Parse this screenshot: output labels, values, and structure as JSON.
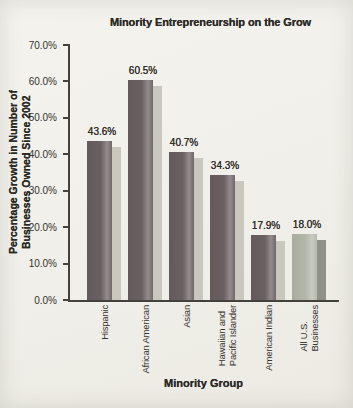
{
  "chart_data": {
    "type": "bar",
    "title": "Minority Entrepreneurship on the Grow",
    "xlabel": "Minority Group",
    "ylabel": "Percentage Growth in Number of Businesses Owned Since 2002",
    "ylabel_lines": [
      "Percentage Growth in Number of",
      "Businesses Owned Since 2002"
    ],
    "categories": [
      "Hispanic",
      "African American",
      "Asian",
      "Hawaiian and Pacific Islander",
      "American Indian",
      "All U.S. Businesses"
    ],
    "category_label_lines": [
      [
        "Hispanic"
      ],
      [
        "African American"
      ],
      [
        "Asian"
      ],
      [
        "Hawaiian and",
        "Pacific Islander"
      ],
      [
        "American Indian"
      ],
      [
        "All U.S.",
        "Businesses"
      ]
    ],
    "values": [
      43.6,
      60.5,
      40.7,
      34.3,
      17.9,
      18.0
    ],
    "value_labels": [
      "43.6%",
      "60.5%",
      "40.7%",
      "34.3%",
      "17.9%",
      "18.0%"
    ],
    "ytick_values": [
      0,
      10,
      20,
      30,
      40,
      50,
      60,
      70
    ],
    "ytick_labels": [
      "0.0%",
      "10.0%",
      "20.0%",
      "30.0%",
      "40.0%",
      "50.0%",
      "60.0%",
      "70.0%"
    ],
    "ylim": [
      0,
      70
    ],
    "grid": "off",
    "legend": "none",
    "bar_colors": [
      "#6a5f61",
      "#6a5f61",
      "#6a5f61",
      "#6a5f61",
      "#6a5f61",
      "#b3b6aa"
    ],
    "bar_shadow_colors": [
      "#c9c7be",
      "#c9c7be",
      "#c9c7be",
      "#c9c7be",
      "#c9c7be",
      "#90928a"
    ],
    "colors": {
      "axis": "#45423e",
      "text": "#2c2a26",
      "background": "#f0efe9"
    }
  }
}
